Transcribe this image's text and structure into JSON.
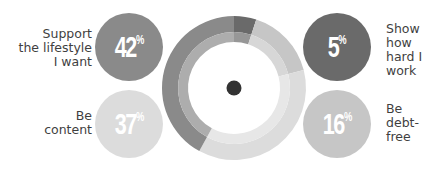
{
  "chart_data": {
    "type": "pie",
    "subtype": "donut",
    "title": "",
    "categories": [
      "Show how hard I work",
      "Be debt-free",
      "Be content",
      "Support the lifestyle I want"
    ],
    "values": [
      5,
      16,
      37,
      42
    ],
    "unit": "%",
    "colors": [
      "#6a6a6a",
      "#c6c6c6",
      "#dcdcdc",
      "#8a8a8a"
    ],
    "legend_position": "flanking bubbles"
  },
  "items": [
    {
      "label_lines": [
        "Support",
        "the lifestyle",
        "I want"
      ],
      "value": "42",
      "sign": "%",
      "color": "#8a8a8a"
    },
    {
      "label_lines": [
        "Be",
        "content"
      ],
      "value": "37",
      "sign": "%",
      "color": "#dcdcdc"
    },
    {
      "label_lines": [
        "Show",
        "how",
        "hard I",
        "work"
      ],
      "value": "5",
      "sign": "%",
      "color": "#6a6a6a"
    },
    {
      "label_lines": [
        "Be",
        "debt-",
        "free"
      ],
      "value": "16",
      "sign": "%",
      "color": "#c6c6c6"
    }
  ],
  "center_dot_color": "#333333"
}
